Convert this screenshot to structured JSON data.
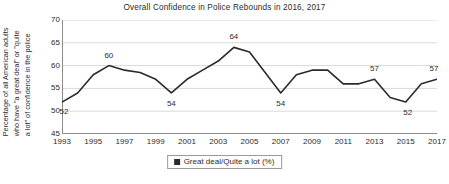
{
  "chart_data": {
    "type": "line",
    "title": "Overall Confidence in Police Rebounds in 2016, 2017",
    "xlabel": "",
    "ylabel": "Percentage of all American adults who have \"a great deal\" or \"quite a lot\" of confidence in the police",
    "ylabel_lines": [
      "Percentage of all American adults",
      "who have \"a great deal\" or \"quite",
      "a lot\" of confidence in the police"
    ],
    "ylim": [
      45,
      70
    ],
    "y_ticks": [
      45,
      50,
      55,
      60,
      65,
      70
    ],
    "y_tick_labels": [
      "45",
      "50",
      "55",
      "60",
      "65",
      "70"
    ],
    "xlim": [
      1993,
      2017
    ],
    "x_ticks": [
      1993,
      1995,
      1997,
      1999,
      2001,
      2003,
      2005,
      2007,
      2009,
      2011,
      2013,
      2015,
      2017
    ],
    "x_tick_labels": [
      "1993",
      "1995",
      "1997",
      "1999",
      "2001",
      "2003",
      "2005",
      "2007",
      "2009",
      "2011",
      "2013",
      "2015",
      "2017"
    ],
    "grid": true,
    "grid_axis": "y",
    "legend_position": "bottom",
    "x": [
      1993,
      1994,
      1995,
      1996,
      1997,
      1998,
      1999,
      2000,
      2001,
      2002,
      2003,
      2004,
      2005,
      2006,
      2007,
      2008,
      2009,
      2010,
      2011,
      2012,
      2013,
      2014,
      2015,
      2016,
      2017
    ],
    "categories": [
      "1993",
      "1994",
      "1995",
      "1996",
      "1997",
      "1998",
      "1999",
      "2000",
      "2001",
      "2002",
      "2003",
      "2004",
      "2005",
      "2006",
      "2007",
      "2008",
      "2009",
      "2010",
      "2011",
      "2012",
      "2013",
      "2014",
      "2015",
      "2016",
      "2017"
    ],
    "series": [
      {
        "name": "Great deal/Quite a lot (%)",
        "color": "#2b2b2b",
        "values": [
          52,
          54,
          58,
          60,
          59,
          58.5,
          57,
          54,
          57,
          59,
          61,
          64,
          63,
          58.5,
          54,
          58,
          59,
          59,
          56,
          56,
          57,
          53,
          52,
          56,
          57
        ]
      }
    ],
    "annotations": [
      {
        "x": 1993,
        "y": 52,
        "text": "52",
        "dx": 2,
        "dy": 10
      },
      {
        "x": 1996,
        "y": 60,
        "text": "60",
        "dx": 0,
        "dy": -10
      },
      {
        "x": 2000,
        "y": 54,
        "text": "54",
        "dx": 0,
        "dy": 11
      },
      {
        "x": 2004,
        "y": 64,
        "text": "64",
        "dx": 0,
        "dy": -10
      },
      {
        "x": 2007,
        "y": 54,
        "text": "54",
        "dx": 0,
        "dy": 11
      },
      {
        "x": 2013,
        "y": 57,
        "text": "57",
        "dx": 0,
        "dy": -10
      },
      {
        "x": 2015,
        "y": 52,
        "text": "52",
        "dx": 2,
        "dy": 11
      },
      {
        "x": 2017,
        "y": 57,
        "text": "57",
        "dx": -3,
        "dy": -10
      }
    ],
    "legend": [
      {
        "label": "Great deal/Quite a lot (%)",
        "color": "#2b2b2b",
        "marker": "square"
      }
    ],
    "colors": {
      "line": "#2b2b2b",
      "grid": "#d9d9d9",
      "axis": "#8c8c8c",
      "text": "#2b2b2b",
      "background": "#ffffff"
    }
  }
}
